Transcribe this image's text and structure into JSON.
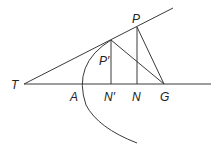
{
  "diagram": {
    "title": "",
    "labels": {
      "T": "T",
      "A": "A",
      "N_prime": "N′",
      "N": "N",
      "G": "G",
      "P": "P",
      "P_prime": "P′"
    },
    "points": {
      "T": [
        24,
        84
      ],
      "A": [
        83,
        84
      ],
      "N_prime": [
        111,
        84
      ],
      "N": [
        137,
        84
      ],
      "G": [
        164,
        84
      ],
      "P": [
        137,
        27
      ],
      "P_prime": [
        111,
        40
      ]
    },
    "elements": [
      "axis line T–G extended",
      "tangent line from T through P′ and P",
      "parabola with vertex near A",
      "ordinate P′N′",
      "ordinate PN",
      "normal P′G",
      "normal PG"
    ],
    "colors": {
      "stroke": "#3a3a3a",
      "text": "#222222",
      "background": "#ffffff"
    }
  }
}
